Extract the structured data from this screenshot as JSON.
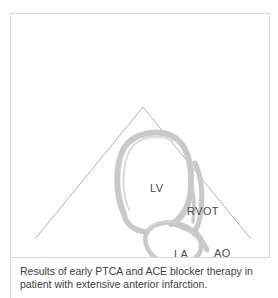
{
  "figure": {
    "modality_label": "echocardiogram-sector-scan",
    "panel_border_color": "#d8d8d8",
    "background_color": "#ffffff",
    "myocardium_color": "#c9c9c9",
    "cavity_color": "#ffffff",
    "sector_line_color": "#9a9aa0",
    "label_color": "#4a4a4a",
    "sector": {
      "apex_x": 143,
      "apex_y": 107,
      "left_end_x": 35,
      "left_end_y": 239,
      "right_end_x": 251,
      "right_end_y": 239
    },
    "labels": [
      {
        "id": "lv",
        "text": "LV",
        "full_name": "left ventricle"
      },
      {
        "id": "rvot",
        "text": "RVOT",
        "full_name": "right ventricular outflow tract"
      },
      {
        "id": "la",
        "text": "LA",
        "full_name": "left atrium"
      },
      {
        "id": "ao",
        "text": "AO",
        "full_name": "aorta"
      }
    ]
  },
  "caption": {
    "line1": "Results of early PTCA and ACE blocker therapy in",
    "line2": "patient with extensive anterior infarction."
  }
}
